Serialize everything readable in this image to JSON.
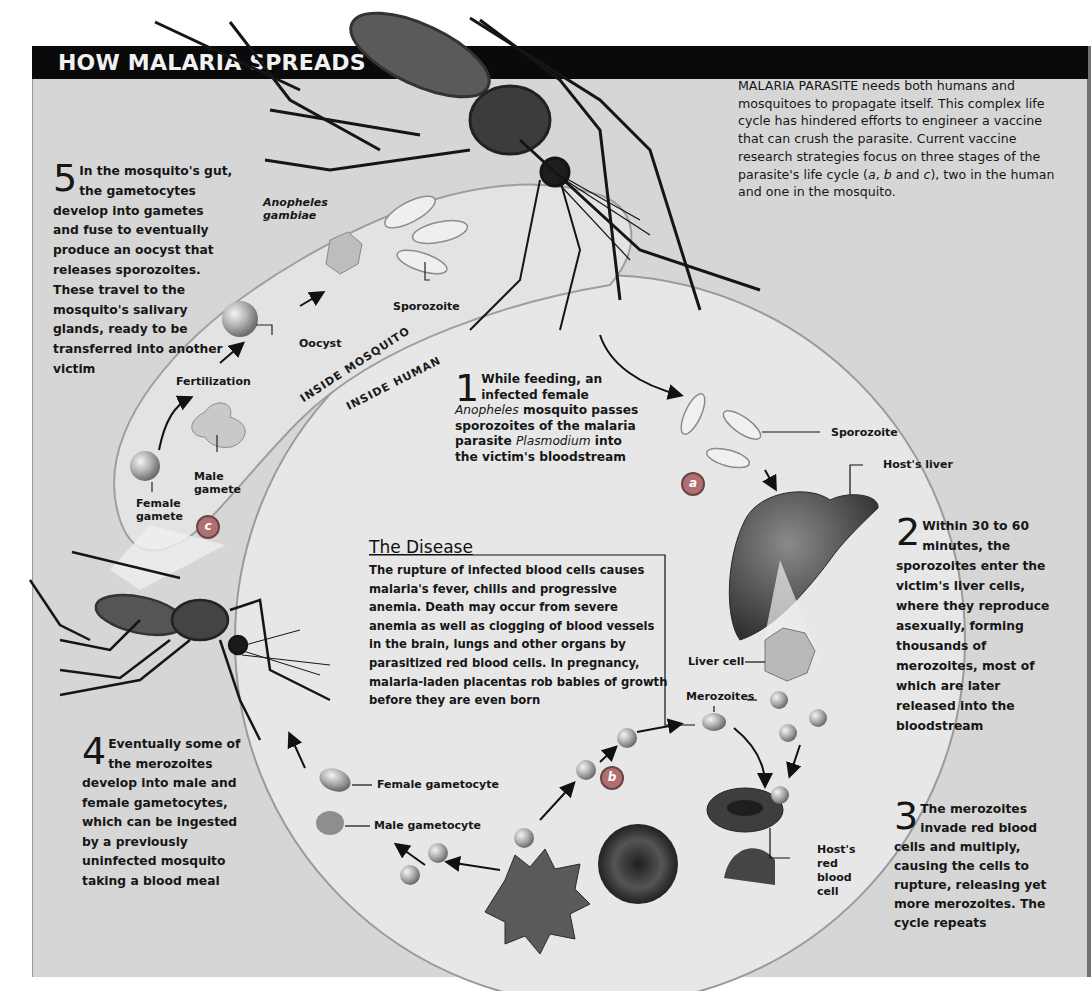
{
  "header": {
    "title": "HOW MALARIA SPREADS"
  },
  "intro": {
    "text_lead": "MALARIA PARASITE",
    "text_body": " needs both humans and mosquitoes to propagate itself. This complex life cycle has hindered efforts to engineer a vaccine that can crush the parasite. Current vaccine research strategies focus on three stages of the parasite's life cycle (",
    "stage_a": "a",
    "sep1": ", ",
    "stage_b": "b",
    "sep2": " and ",
    "stage_c": "c",
    "text_tail": "), two in the human and one in the mosquito."
  },
  "steps": [
    {
      "number": "1",
      "text_pre": "While feeding, an infected female ",
      "italic1": "Anopheles",
      "text_mid": " mosquito passes sporozoites of the malaria parasite ",
      "italic2": "Plasmodium",
      "text_post": " into the victim's bloodstream"
    },
    {
      "number": "2",
      "text": "Within 30 to 60 minutes, the sporozoites enter the victim's liver cells, where they reproduce asexually, forming thousands of merozoites, most of which are later released into the bloodstream"
    },
    {
      "number": "3",
      "text": "The merozoites invade red blood cells and multiply, causing the cells to rupture, releasing yet more merozoites. The cycle repeats"
    },
    {
      "number": "4",
      "text": "Eventually some of the merozoites develop into male and female gametocytes, which can be ingested by a previously uninfected mosquito taking a blood meal"
    },
    {
      "number": "5",
      "text": "In the mosquito's gut, the gametocytes develop into gametes and fuse to eventually produce an oocyst that releases sporozoites. These travel to the mosquito's salivary glands, ready to be transferred into another victim"
    }
  ],
  "disease": {
    "title": "The Disease",
    "text": "The rupture of infected blood cells causes malaria's fever, chills and progressive anemia. Death may occur from severe anemia as well as clogging of blood vessels in the brain, lungs and other organs by parasitized red blood cells. In pregnancy, malaria-laden placentas rob babies of growth before they are even born"
  },
  "regions": {
    "mosquito": "INSIDE MOSQUITO",
    "human": "INSIDE HUMAN"
  },
  "species": {
    "line1": "Anopheles",
    "line2": "gambiae"
  },
  "labels": {
    "sporozoite_mosquito": "Sporozoite",
    "oocyst": "Oocyst",
    "fertilization": "Fertilization",
    "male_gamete": "Male gamete",
    "female_gamete": "Female gamete",
    "sporozoite_human": "Sporozoite",
    "hosts_liver": "Host's liver",
    "liver_cell": "Liver cell",
    "merozoites": "Merozoites",
    "female_gametocyte": "Female gametocyte",
    "male_gametocyte": "Male gametocyte",
    "hosts_rbc": "Host's red blood cell"
  },
  "badges": {
    "a": "a",
    "b": "b",
    "c": "c"
  },
  "colors": {
    "panel": "#d6d6d6",
    "title_bar": "#0a0a0a",
    "badge": "#b07070",
    "cell_dark": "#3a3a3a"
  }
}
